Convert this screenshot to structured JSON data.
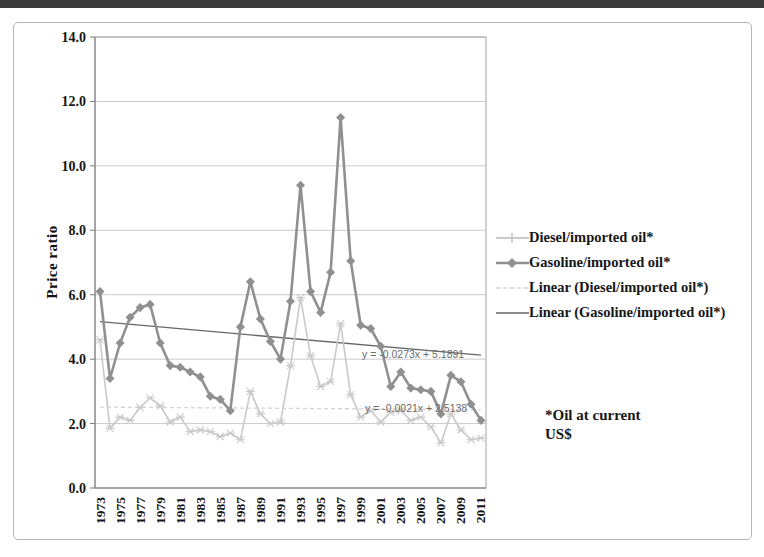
{
  "page": {
    "background": "#ffffff",
    "top_edge_color": "#3b3b3b"
  },
  "chart_data": {
    "type": "line",
    "title": "",
    "xlabel": "",
    "ylabel": "Price ratio",
    "ylim": [
      0,
      14
    ],
    "ytick_step": 2,
    "ytick_labels": [
      "0.0",
      "2.0",
      "4.0",
      "6.0",
      "8.0",
      "10.0",
      "12.0",
      "14.0"
    ],
    "grid": true,
    "x": [
      1973,
      1974,
      1975,
      1976,
      1977,
      1978,
      1979,
      1980,
      1981,
      1982,
      1983,
      1984,
      1985,
      1986,
      1987,
      1988,
      1989,
      1990,
      1991,
      1992,
      1993,
      1994,
      1995,
      1996,
      1997,
      1998,
      1999,
      2000,
      2001,
      2002,
      2003,
      2004,
      2005,
      2006,
      2007,
      2008,
      2009,
      2010,
      2011
    ],
    "xtick_labels": [
      "1973",
      "1975",
      "1977",
      "1979",
      "1981",
      "1983",
      "1985",
      "1987",
      "1989",
      "1991",
      "1993",
      "1995",
      "1997",
      "1999",
      "2001",
      "2003",
      "2005",
      "2007",
      "2009",
      "2011"
    ],
    "series": [
      {
        "name": "Diesel/imported oil*",
        "marker": "x-cross",
        "color": "#c9c9c9",
        "width": 1.6,
        "values": [
          4.6,
          1.85,
          2.2,
          2.1,
          2.5,
          2.8,
          2.55,
          2.05,
          2.2,
          1.75,
          1.8,
          1.75,
          1.6,
          1.7,
          1.5,
          3.0,
          2.3,
          2.0,
          2.05,
          3.8,
          5.9,
          4.1,
          3.15,
          3.3,
          5.1,
          2.9,
          2.2,
          2.4,
          2.05,
          2.35,
          2.4,
          2.1,
          2.2,
          1.9,
          1.4,
          2.3,
          1.8,
          1.5,
          1.55
        ]
      },
      {
        "name": "Gasoline/imported oil*",
        "marker": "diamond",
        "color": "#909090",
        "width": 2.6,
        "values": [
          6.1,
          3.4,
          4.5,
          5.3,
          5.6,
          5.7,
          4.5,
          3.8,
          3.75,
          3.6,
          3.45,
          2.85,
          2.75,
          2.4,
          5.0,
          6.4,
          5.25,
          4.55,
          4.0,
          5.8,
          9.4,
          6.1,
          5.45,
          6.7,
          11.5,
          7.05,
          5.05,
          4.95,
          4.4,
          3.15,
          3.6,
          3.1,
          3.05,
          3.0,
          2.3,
          3.5,
          3.3,
          2.6,
          2.1
        ]
      }
    ],
    "trendlines": [
      {
        "name": "Linear (Gasoline/imported oil*)",
        "equation": "y = -0.0273x + 5.1891",
        "slope": -0.0273,
        "intercept": 5.1891,
        "color": "#666666",
        "dash": "",
        "label_pos": [
          362,
          358
        ]
      },
      {
        "name": "Linear (Diesel/imported oil*)",
        "equation": "y = -0.0021x + 2.5138",
        "slope": -0.0021,
        "intercept": 2.5138,
        "color": "#d4d4d4",
        "dash": "4 3",
        "label_pos": [
          365,
          412
        ]
      }
    ],
    "legend": {
      "position": "right",
      "items": [
        {
          "label": "Diesel/imported oil*",
          "sample": "light-line-plus-marker"
        },
        {
          "label": "Gasoline/imported oil*",
          "sample": "dark-line-diamond-marker"
        },
        {
          "label": "Linear (Diesel/imported oil*)",
          "sample": "light-dashed-line"
        },
        {
          "label": "Linear (Gasoline/imported oil*)",
          "sample": "dark-solid-line"
        }
      ]
    },
    "footnote_lines": [
      "*Oil at current",
      "US$"
    ]
  }
}
